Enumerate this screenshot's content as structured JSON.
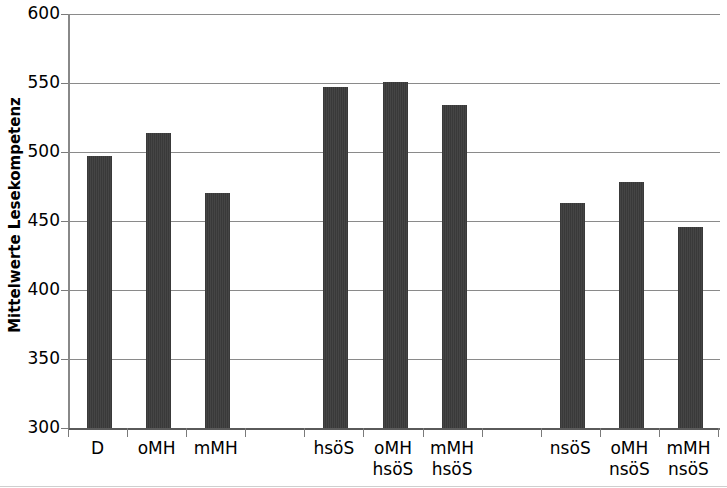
{
  "chart_data": {
    "type": "bar",
    "title": "",
    "subtitle": "",
    "xlabel": "",
    "ylabel": "Mittelwerte Lesekompetenz",
    "ylim": [
      300,
      600
    ],
    "yticks": [
      300,
      350,
      400,
      450,
      500,
      550,
      600
    ],
    "ytick_labels": [
      "300",
      "350",
      "400",
      "450",
      "500",
      "550",
      "600"
    ],
    "grid": true,
    "legend": "none",
    "categories": [
      "D",
      "oMH",
      "mMH",
      "hsöS",
      "oMH\nhsöS",
      "mMH\nhsöS",
      "nsöS",
      "oMH\nnsöS",
      "mMH\nnsöS"
    ],
    "values": [
      497,
      514,
      470,
      547,
      551,
      534,
      463,
      478,
      446
    ],
    "groups": [
      {
        "name": "gesamt",
        "categories": [
          "D",
          "oMH",
          "mMH"
        ]
      },
      {
        "name": "hsöS",
        "categories": [
          "hsöS",
          "oMH hsöS",
          "mMH hsöS"
        ]
      },
      {
        "name": "nsöS",
        "categories": [
          "nsöS",
          "oMH nsöS",
          "mMH nsöS"
        ]
      }
    ],
    "bar_color": "#3b3b3b",
    "grid_color": "#8a8a8a",
    "background": "#ffffff"
  },
  "axis": {
    "y_title": "Mittelwerte Lesekompetenz"
  }
}
